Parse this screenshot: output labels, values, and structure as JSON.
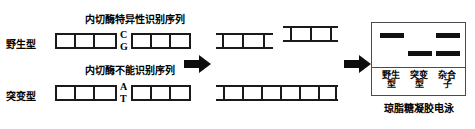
{
  "diagram": {
    "title_wild_site": "内切酶特异性识别序列",
    "title_mutant_site": "内切酶不能识别序列",
    "row_labels": {
      "wild": "野生型",
      "mutant": "突变型"
    },
    "bases": {
      "wild_top": "C",
      "wild_bottom": "G",
      "mutant_top": "A",
      "mutant_bottom": "T"
    },
    "arrows": {
      "digest": "right-arrow",
      "electrophoresis": "right-arrow"
    }
  },
  "gel": {
    "caption": "琼脂糖凝胶电泳",
    "lanes": [
      {
        "label_line1": "野生",
        "label_line2": "型",
        "bands": [
          "upper"
        ]
      },
      {
        "label_line1": "突变",
        "label_line2": "型",
        "bands": [
          "lower"
        ]
      },
      {
        "label_line1": "杂合",
        "label_line2": "子",
        "bands": [
          "upper",
          "lower"
        ]
      }
    ]
  },
  "colors": {
    "ink": "#111111",
    "line": "#1a1a1a",
    "box_border": "#4a4a52",
    "background": "#ffffff"
  }
}
